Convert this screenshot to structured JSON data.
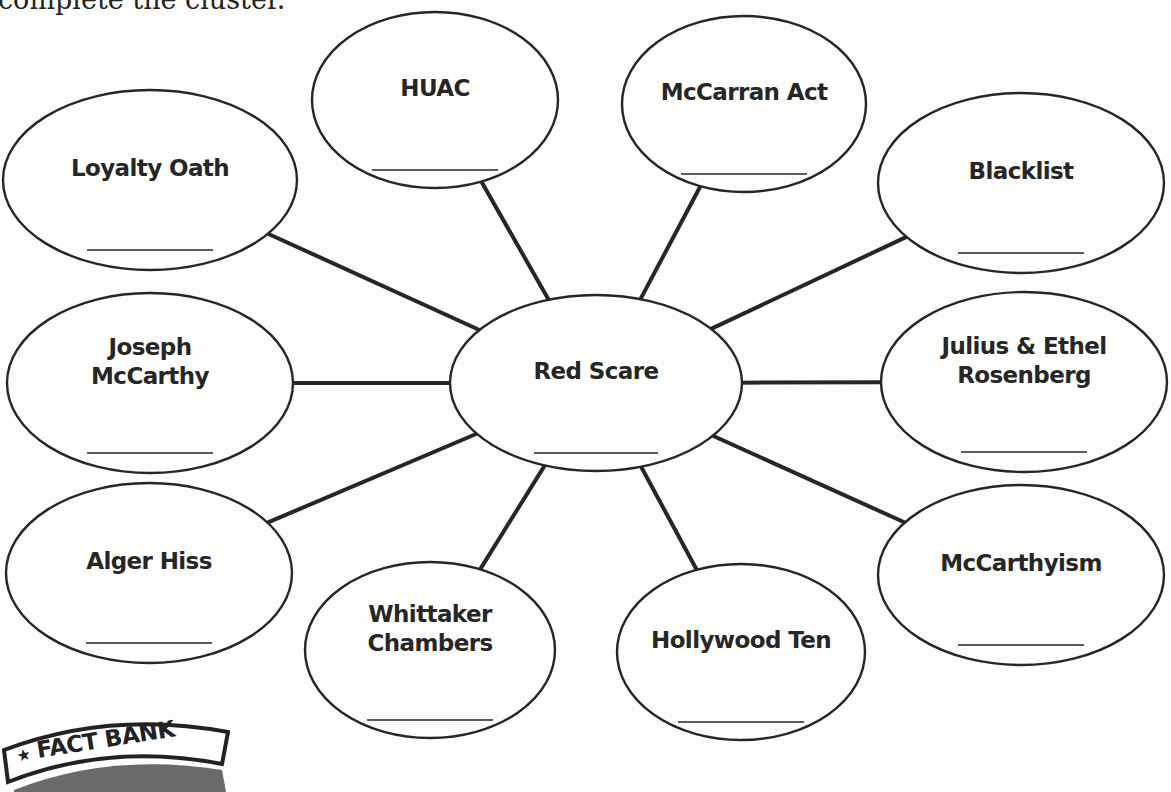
{
  "instructions_fragment": "complete the cluster.",
  "center": {
    "id": "red-scare",
    "label_lines": [
      "Red Scare"
    ],
    "answer_blank": ""
  },
  "nodes": [
    {
      "id": "loyalty-oath",
      "label_lines": [
        "Loyalty Oath"
      ],
      "answer_blank": ""
    },
    {
      "id": "huac",
      "label_lines": [
        "HUAC"
      ],
      "answer_blank": ""
    },
    {
      "id": "mccarran-act",
      "label_lines": [
        "McCarran Act"
      ],
      "answer_blank": ""
    },
    {
      "id": "blacklist",
      "label_lines": [
        "Blacklist"
      ],
      "answer_blank": ""
    },
    {
      "id": "joseph-mccarthy",
      "label_lines": [
        "Joseph",
        "McCarthy"
      ],
      "answer_blank": ""
    },
    {
      "id": "julius-ethel-rosenberg",
      "label_lines": [
        "Julius & Ethel",
        "Rosenberg"
      ],
      "answer_blank": ""
    },
    {
      "id": "alger-hiss",
      "label_lines": [
        "Alger Hiss"
      ],
      "answer_blank": ""
    },
    {
      "id": "whittaker-chambers",
      "label_lines": [
        "Whittaker",
        "Chambers"
      ],
      "answer_blank": ""
    },
    {
      "id": "hollywood-ten",
      "label_lines": [
        "Hollywood Ten"
      ],
      "answer_blank": ""
    },
    {
      "id": "mccarthyism",
      "label_lines": [
        "McCarthyism"
      ],
      "answer_blank": ""
    }
  ],
  "fact_bank": {
    "star": "★",
    "title": "FACT BANK"
  },
  "colors": {
    "ink": "#262626",
    "paper": "#fdfdfc"
  }
}
